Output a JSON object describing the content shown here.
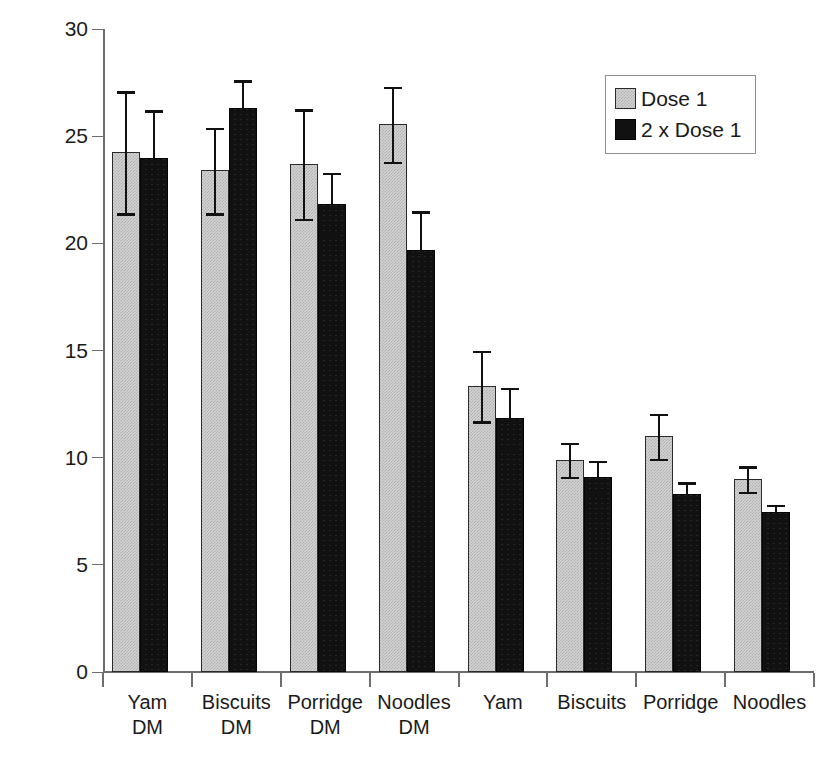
{
  "chart_data": {
    "type": "bar",
    "title": "",
    "xlabel": "",
    "ylabel": "IAUC/GGE",
    "ylim": [
      0,
      30
    ],
    "ytick_values": [
      0,
      5,
      10,
      15,
      20,
      25,
      30
    ],
    "ytick_labels": [
      "0",
      "5",
      "10",
      "15",
      "20",
      "25",
      "30"
    ],
    "grid": false,
    "legend_position": "top-right",
    "categories": [
      "Yam\nDM",
      "Biscuits\nDM",
      "Porridge\nDM",
      "Noodles\nDM",
      "Yam",
      "Biscuits",
      "Porridge",
      "Noodles"
    ],
    "series": [
      {
        "name": "Dose 1",
        "color": "#d2d2d2",
        "values": [
          24.25,
          23.4,
          23.7,
          25.55,
          13.35,
          9.9,
          11.0,
          9.0
        ],
        "errors": [
          2.85,
          2.0,
          2.55,
          1.75,
          1.65,
          0.8,
          1.05,
          0.6
        ]
      },
      {
        "name": "2 x Dose 1",
        "color": "#111111",
        "values": [
          24.0,
          26.3,
          21.85,
          19.7,
          11.85,
          9.1,
          8.3,
          7.45
        ],
        "errors": [
          2.2,
          1.3,
          1.45,
          1.8,
          1.4,
          0.75,
          0.55,
          0.35
        ]
      }
    ]
  },
  "legend": {
    "items": [
      {
        "label": "Dose 1"
      },
      {
        "label": "2 x Dose 1"
      }
    ]
  },
  "axes": {
    "y_label": "IAUC/GGE"
  }
}
